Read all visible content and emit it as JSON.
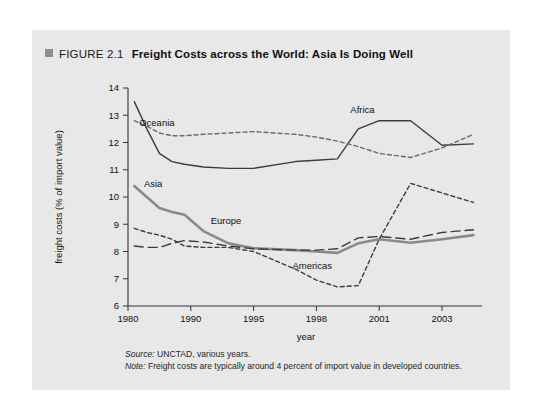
{
  "figure": {
    "label": "FIGURE 2.1",
    "title": "Freight Costs across the World: Asia Is Doing Well",
    "marker_color": "#8d8d8d",
    "card_background": "#e8e8e8"
  },
  "notes": {
    "source_label": "Source:",
    "source_text": " UNCTAD, various years.",
    "note_label": "Note:",
    "note_text": " Freight costs are typically around 4 percent of import value in developed countries."
  },
  "chart_data": {
    "type": "line",
    "title": "Freight Costs across the World: Asia Is Doing Well",
    "xlabel": "year",
    "ylabel": "freight costs (% of import value)",
    "xlim": [
      1980,
      2004
    ],
    "ylim": [
      6,
      14
    ],
    "grid": false,
    "legend": "inline-labels",
    "xticks": [
      1980,
      1990,
      1995,
      1998,
      2001,
      2003
    ],
    "xticklabels": [
      "1980",
      "1990",
      "1995",
      "1998",
      "2001",
      "2003"
    ],
    "yticks": [
      6,
      7,
      8,
      9,
      10,
      11,
      12,
      13,
      14
    ],
    "yticklabels": [
      "6",
      "7",
      "8",
      "9",
      "10",
      "11",
      "12",
      "13",
      "14"
    ],
    "x": [
      1981,
      1983,
      1985,
      1987,
      1989,
      1991,
      1993,
      1995,
      1997,
      1998,
      1999,
      2000,
      2001,
      2002,
      2003,
      2004
    ],
    "series": [
      {
        "name": "Africa",
        "style": "solid",
        "color": "#3c3c3c",
        "width": 1.4,
        "label_x": 2000.2,
        "label_y": 13.1,
        "values": [
          13.5,
          12.5,
          11.6,
          11.3,
          11.2,
          11.1,
          11.05,
          11.05,
          11.3,
          11.35,
          11.4,
          12.5,
          12.8,
          12.8,
          11.9,
          11.95
        ]
      },
      {
        "name": "Oceania",
        "style": "dashed-short",
        "color": "#6b6b6b",
        "width": 1.4,
        "label_x": 1984.6,
        "label_y": 12.62,
        "values": [
          12.8,
          12.6,
          12.35,
          12.25,
          12.25,
          12.3,
          12.35,
          12.4,
          12.3,
          12.2,
          12.05,
          11.85,
          11.6,
          11.45,
          11.8,
          12.3
        ]
      },
      {
        "name": "Asia",
        "style": "solid-thick",
        "color": "#8a8a8a",
        "width": 2.6,
        "label_x": 1984.0,
        "label_y": 10.35,
        "values": [
          10.4,
          10.0,
          9.6,
          9.45,
          9.35,
          8.75,
          8.3,
          8.12,
          8.05,
          8.0,
          7.95,
          8.3,
          8.45,
          8.32,
          8.45,
          8.6
        ]
      },
      {
        "name": "Europe",
        "style": "dashed-long",
        "color": "#3c3c3c",
        "width": 1.4,
        "label_x": 1992.8,
        "label_y": 9.0,
        "values": [
          8.2,
          8.15,
          8.15,
          8.3,
          8.4,
          8.35,
          8.2,
          8.1,
          8.05,
          8.05,
          8.1,
          8.5,
          8.55,
          8.45,
          8.7,
          8.8
        ]
      },
      {
        "name": "Americas",
        "style": "dashed-short",
        "color": "#3c3c3c",
        "width": 1.4,
        "label_x": 1997.8,
        "label_y": 7.35,
        "values": [
          8.85,
          8.7,
          8.6,
          8.45,
          8.2,
          8.15,
          8.15,
          8.0,
          7.35,
          6.95,
          6.7,
          6.75,
          8.45,
          10.5,
          10.15,
          9.8
        ]
      }
    ]
  }
}
